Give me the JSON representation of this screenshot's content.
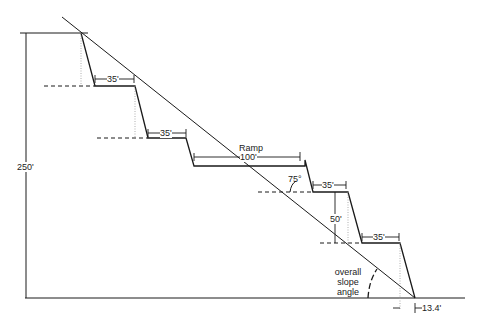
{
  "diagram": {
    "type": "open-pit bench slope cross-section",
    "labels": {
      "overall_height": "250'",
      "bench_width_1": "35'",
      "bench_width_2": "35'",
      "ramp_title": "Ramp",
      "ramp_width": "100'",
      "face_angle": "75°",
      "bench_width_3": "35'",
      "bench_height": "50'",
      "bench_width_4": "35'",
      "slope_angle_line1": "overall",
      "slope_angle_line2": "slope",
      "slope_angle_line3": "angle",
      "toe_offset": "13.4'"
    },
    "colors": {
      "line": "#1a1a1a",
      "dotted": "#9a9a9a",
      "background": "#ffffff"
    }
  }
}
